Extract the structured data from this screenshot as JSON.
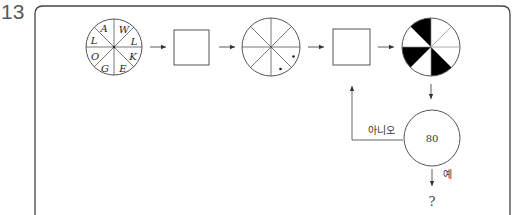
{
  "question_number": "13",
  "diagram": {
    "input_wheel": {
      "letters": [
        "A",
        "W",
        "L",
        "K",
        "E",
        "G",
        "O",
        "L"
      ]
    },
    "process_box_1": {
      "label": ""
    },
    "intermediate_wheel": {
      "dots": 2
    },
    "process_box_2": {
      "label": ""
    },
    "output_wheel": {
      "filled_segments": 3,
      "fill_color": "#000000"
    },
    "decision": {
      "value": "80"
    },
    "branch_no_label": "아니오",
    "branch_yes_label": "예",
    "result": "?"
  },
  "colors": {
    "line": "#555555",
    "frame": "#444444",
    "fill": "#000000"
  }
}
